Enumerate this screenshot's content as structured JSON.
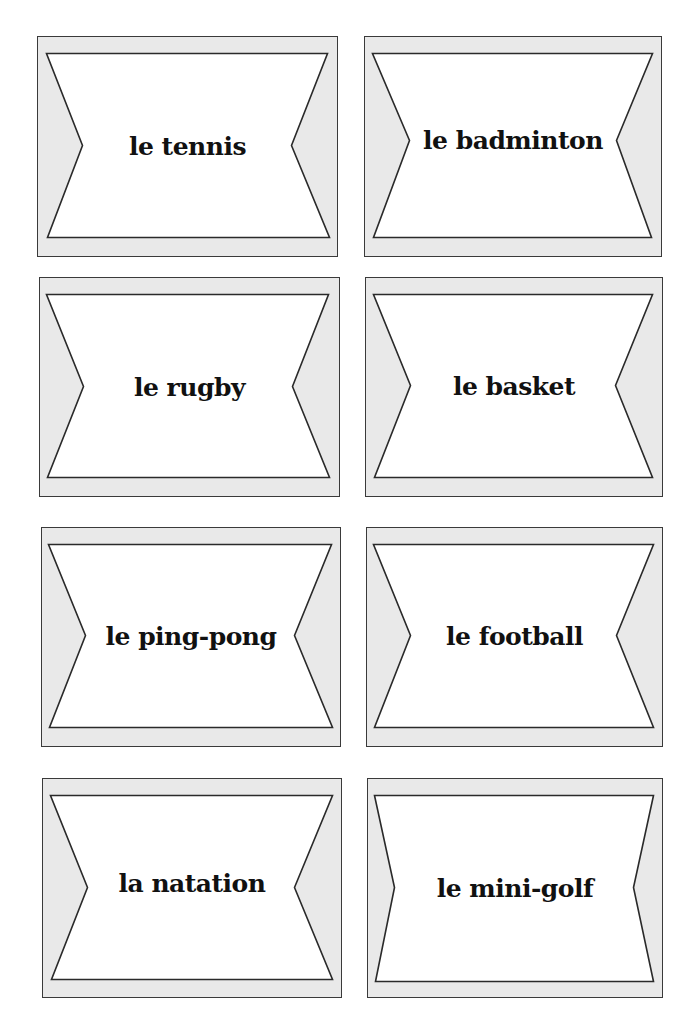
{
  "sheet": {
    "title": "",
    "card_fill": "#e9e9e9",
    "card_border": "#3a3a3a",
    "label_color": "#111111"
  },
  "cards": [
    {
      "label": "le tennis",
      "box": [
        37,
        36,
        301,
        221
      ],
      "shape": [
        [
          10,
          18
        ],
        [
          291,
          18
        ],
        [
          255,
          110
        ],
        [
          293,
          202
        ],
        [
          11,
          202
        ],
        [
          46,
          110
        ]
      ],
      "label_y": 95
    },
    {
      "label": "le badminton",
      "box": [
        364,
        36,
        298,
        221
      ],
      "shape": [
        [
          9,
          18
        ],
        [
          289,
          18
        ],
        [
          253,
          105
        ],
        [
          288,
          202
        ],
        [
          10,
          202
        ],
        [
          46,
          105
        ]
      ],
      "label_y": 89
    },
    {
      "label": "le rugby",
      "box": [
        39,
        277,
        301,
        220
      ],
      "shape": [
        [
          8,
          18
        ],
        [
          290,
          18
        ],
        [
          254,
          110
        ],
        [
          291,
          201
        ],
        [
          9,
          201
        ],
        [
          45,
          110
        ]
      ],
      "label_y": 95
    },
    {
      "label": "le basket",
      "box": [
        365,
        277,
        298,
        220
      ],
      "shape": [
        [
          9,
          18
        ],
        [
          288,
          18
        ],
        [
          251,
          109
        ],
        [
          288,
          201
        ],
        [
          10,
          201
        ],
        [
          46,
          109
        ]
      ],
      "label_y": 94
    },
    {
      "label": "le ping-pong",
      "box": [
        41,
        527,
        300,
        220
      ],
      "shape": [
        [
          8,
          18
        ],
        [
          291,
          18
        ],
        [
          254,
          109
        ],
        [
          292,
          201
        ],
        [
          9,
          201
        ],
        [
          45,
          109
        ]
      ],
      "label_y": 94
    },
    {
      "label": "le football",
      "box": [
        366,
        527,
        297,
        220
      ],
      "shape": [
        [
          8,
          18
        ],
        [
          288,
          18
        ],
        [
          251,
          109
        ],
        [
          288,
          201
        ],
        [
          9,
          201
        ],
        [
          45,
          109
        ]
      ],
      "label_y": 94
    },
    {
      "label": "la natation",
      "box": [
        42,
        778,
        300,
        220
      ],
      "shape": [
        [
          9,
          18
        ],
        [
          291,
          18
        ],
        [
          253,
          110
        ],
        [
          291,
          202
        ],
        [
          10,
          202
        ],
        [
          46,
          110
        ]
      ],
      "label_y": 90
    },
    {
      "label": "le mini-golf",
      "box": [
        367,
        778,
        296,
        220
      ],
      "shape": [
        [
          8,
          18
        ],
        [
          287,
          18
        ],
        [
          267,
          110
        ],
        [
          287,
          204
        ],
        [
          9,
          204
        ],
        [
          28,
          110
        ]
      ],
      "label_y": 95
    }
  ]
}
